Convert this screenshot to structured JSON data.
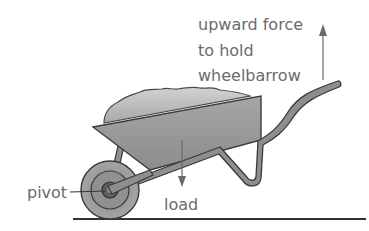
{
  "diagram": {
    "labels": {
      "force_line1": "upward force",
      "force_line2": "to hold",
      "force_line3": "wheelbarrow",
      "pivot": "pivot",
      "load": "load"
    },
    "colors": {
      "text": "#6b6b6b",
      "outline": "#3a3a3a",
      "tray_fill": "#9a9a9a",
      "load_fill": "#b5b5b5",
      "frame_fill": "#8e8e8e",
      "wheel_outer": "#a0a0a0",
      "wheel_inner": "#8a8a8a",
      "hub": "#555555",
      "ground": "#333333",
      "arrow": "#707070"
    }
  }
}
